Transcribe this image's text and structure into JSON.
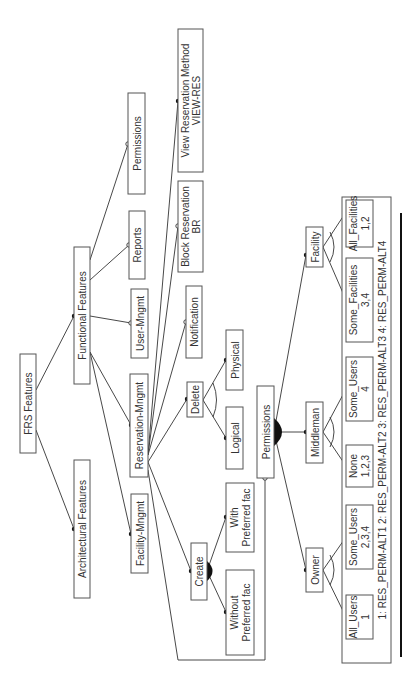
{
  "diagram": {
    "title": "FRS Features",
    "orientation": "rotated-90-ccw",
    "nodes": {
      "root": {
        "label": "FRS Features"
      },
      "architectural": {
        "label": "Architectural  Features"
      },
      "functional": {
        "label": "Functional Features"
      },
      "facility_mngmt": {
        "label": "Facility-Mngmt"
      },
      "reservation_mngmt": {
        "label": "Reservation-Mngmt"
      },
      "user_mngmt": {
        "label": "User-Mngmt"
      },
      "reports": {
        "label": "Reports"
      },
      "permissions_top": {
        "label": "Permissions"
      },
      "notification": {
        "label": "Notification"
      },
      "block_reservation": {
        "line1": "Block Reservation",
        "line2": "BR"
      },
      "view_reservation": {
        "line1": "View Reservation Method",
        "line2": "VIEW-RES"
      },
      "delete": {
        "label": "Delete"
      },
      "create": {
        "label": "Create"
      },
      "logical": {
        "label": "Logical"
      },
      "physical": {
        "label": "Physical"
      },
      "with_pref": {
        "line1": "With",
        "line2": "Preferred fac"
      },
      "without_pref": {
        "line1": "Without",
        "line2": "Preferred fac"
      },
      "permissions": {
        "label": "Permissions"
      },
      "owner": {
        "label": "Owner"
      },
      "middleman": {
        "label": "Middleman"
      },
      "facility": {
        "label": "Facility"
      },
      "all_users": {
        "line1": "All_Users",
        "line2": "1"
      },
      "some_users_owner": {
        "line1": "Some_Users",
        "line2": "2,3,4"
      },
      "none": {
        "line1": "None",
        "line2": "1,2,3"
      },
      "some_users_mid": {
        "line1": "Some_Users",
        "line2": "4"
      },
      "some_facilities": {
        "line1": "Some_Facilities",
        "line2": "3,4"
      },
      "all_facilities": {
        "line1": "All_Facilities",
        "line2": "1,2"
      }
    },
    "legend": "1: RES_PERM-ALT1   2:  RES_PERM-ALT2   3:  RES_PERM-ALT3   4: RES_PERM-ALT4"
  }
}
